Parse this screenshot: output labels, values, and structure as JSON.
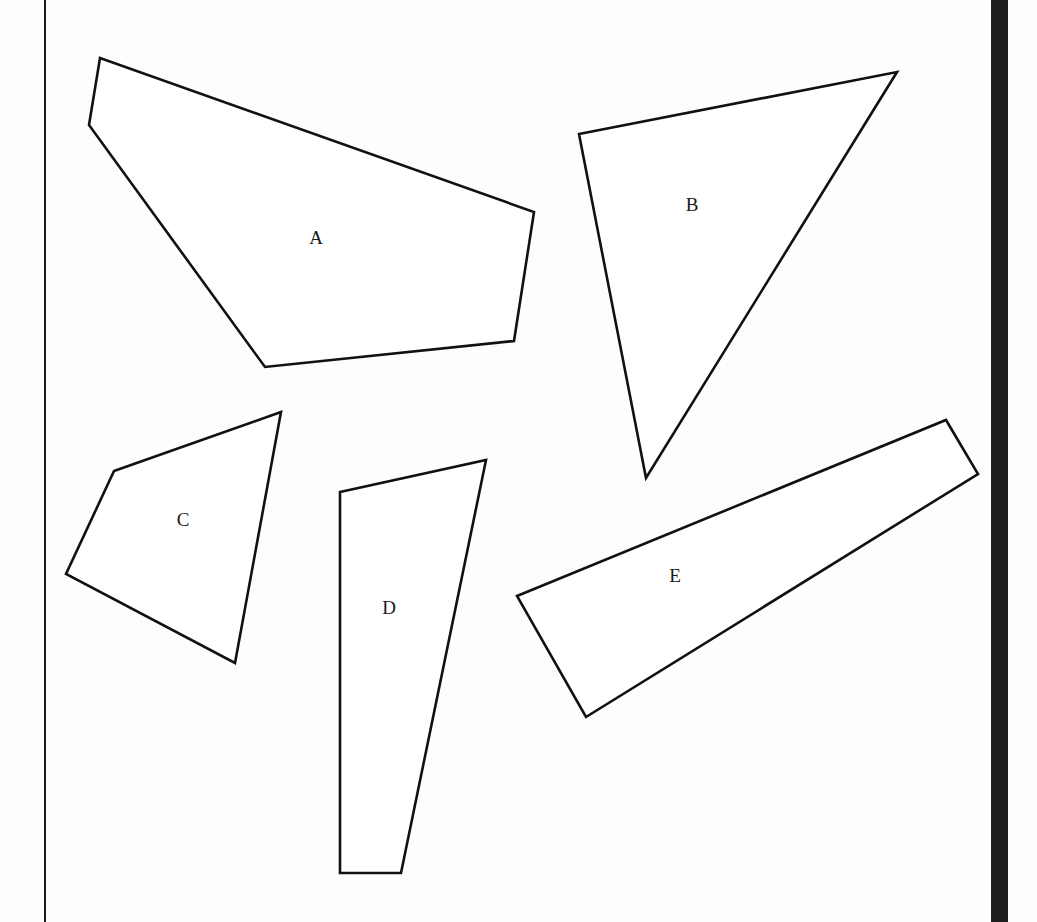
{
  "figure": {
    "shapes": [
      {
        "label": "A",
        "points": "100,58 89,125 265,367 514,341 534,212",
        "label_x": 316,
        "label_y": 240
      },
      {
        "label": "B",
        "points": "579,134 897,72 646,478",
        "label_x": 692,
        "label_y": 207
      },
      {
        "label": "C",
        "points": "114,471 281,412 235,663 66,574",
        "label_x": 183,
        "label_y": 522
      },
      {
        "label": "D",
        "points": "340,492 486,460 401,873 340,873",
        "label_x": 389,
        "label_y": 610
      },
      {
        "label": "E",
        "points": "517,596 946,420 978,474 586,717",
        "label_x": 675,
        "label_y": 578
      }
    ]
  }
}
